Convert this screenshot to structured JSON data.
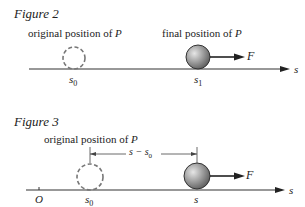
{
  "figure2": {
    "title": "Figure 2",
    "label_original": "original position of",
    "label_final": "final position of",
    "point": "P",
    "force": "F",
    "axis": "s",
    "tick_s0": "s",
    "tick_s0_sub": "0",
    "tick_s1": "s",
    "tick_s1_sub": "1"
  },
  "figure3": {
    "title": "Figure 3",
    "label_original": "original position of",
    "point": "P",
    "force": "F",
    "axis": "s",
    "origin": "O",
    "tick_s0": "s",
    "tick_s0_sub": "0",
    "tick_s": "s",
    "distance_label": "s − s",
    "distance_sub": "0"
  },
  "colors": {
    "line": "#333333",
    "dashed": "#777777",
    "ball_light": "#d8d8d8",
    "ball_dark": "#6a6a6a"
  }
}
